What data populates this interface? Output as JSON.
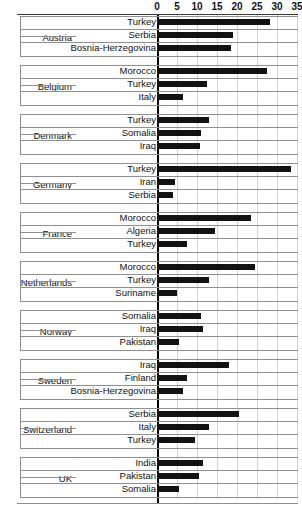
{
  "chart_data": {
    "type": "bar",
    "orientation": "horizontal",
    "title": "",
    "subtitle": "",
    "xlabel": "",
    "ylabel": "",
    "xlim": [
      0,
      35
    ],
    "xticks": [
      0,
      5,
      10,
      15,
      20,
      25,
      30,
      35
    ],
    "grid": true,
    "legend": false,
    "bar_color": "#121212",
    "groups": [
      {
        "name": "Austria",
        "categories": [
          "Turkey",
          "Serbia",
          "Bosnia-Herzegovina"
        ],
        "values": [
          28.3,
          19.0,
          18.5
        ]
      },
      {
        "name": "Belgium",
        "categories": [
          "Morocco",
          "Turkey",
          "Italy"
        ],
        "values": [
          27.5,
          12.5,
          6.5
        ]
      },
      {
        "name": "Denmark",
        "categories": [
          "Turkey",
          "Somalia",
          "Iraq"
        ],
        "values": [
          13.0,
          11.0,
          10.8
        ]
      },
      {
        "name": "Germany",
        "categories": [
          "Turkey",
          "Iran",
          "Serbia"
        ],
        "values": [
          33.5,
          4.6,
          4.0
        ]
      },
      {
        "name": "France",
        "categories": [
          "Morocco",
          "Algeria",
          "Turkey"
        ],
        "values": [
          23.5,
          14.5,
          7.5
        ]
      },
      {
        "name": "Netherlands",
        "categories": [
          "Morocco",
          "Turkey",
          "Suriname"
        ],
        "values": [
          24.5,
          13.0,
          5.0
        ]
      },
      {
        "name": "Norway",
        "categories": [
          "Somalia",
          "Iraq",
          "Pakistan"
        ],
        "values": [
          11.0,
          11.5,
          5.5
        ]
      },
      {
        "name": "Sweden",
        "categories": [
          "Iraq",
          "Finland",
          "Bosnia-Herzegovina"
        ],
        "values": [
          18.0,
          7.5,
          6.5
        ]
      },
      {
        "name": "Switzerland",
        "categories": [
          "Serbia",
          "Italy",
          "Turkey"
        ],
        "values": [
          20.5,
          13.0,
          9.5
        ]
      },
      {
        "name": "UK",
        "categories": [
          "India",
          "Pakistan",
          "Somalia"
        ],
        "values": [
          11.5,
          10.5,
          5.5
        ]
      }
    ]
  }
}
